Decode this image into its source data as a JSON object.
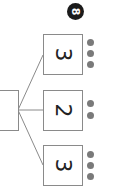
{
  "diagram": {
    "type": "number-bond",
    "orientation": "rotated-90",
    "whole": {
      "label": "8",
      "badge_color": "#1b1b1b"
    },
    "root_box": {
      "value": ""
    },
    "parts": [
      {
        "value": "3",
        "dots": 3
      },
      {
        "value": "2",
        "dots": 2
      },
      {
        "value": "3",
        "dots": 3
      }
    ],
    "colors": {
      "line": "#8a8a8a",
      "dot": "#7a7a7a",
      "text": "#222222"
    }
  }
}
